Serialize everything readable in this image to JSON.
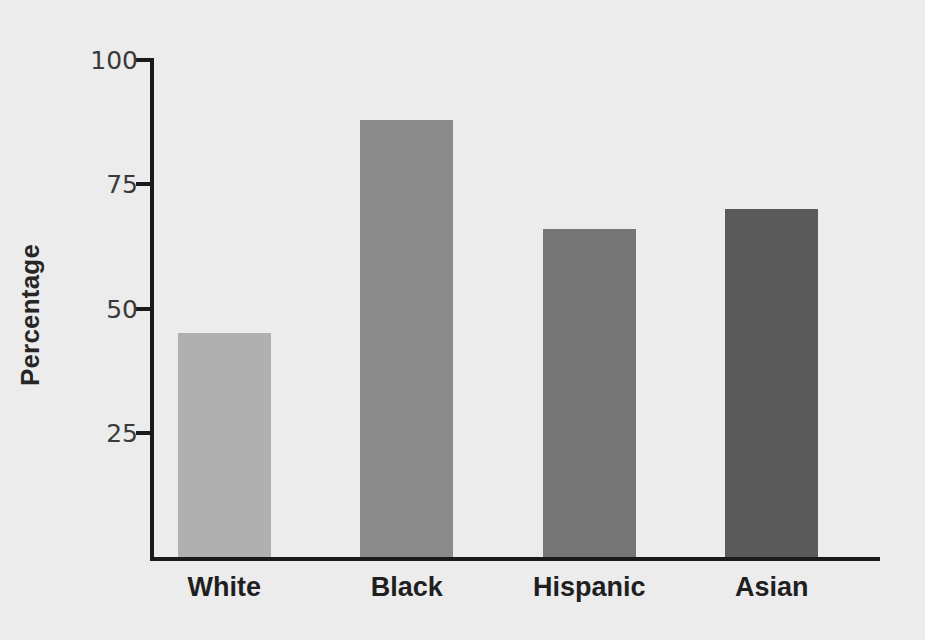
{
  "chart_data": {
    "type": "bar",
    "title": "",
    "xlabel": "",
    "ylabel": "Percentage",
    "categories": [
      "White",
      "Black",
      "Hispanic",
      "Asian"
    ],
    "values": [
      45,
      88,
      66,
      70
    ],
    "bar_colors": [
      "#b0b0b0",
      "#8a8a8a",
      "#757575",
      "#5a5a5a"
    ],
    "ylim": [
      0,
      100
    ],
    "yticks": [
      25,
      50,
      75,
      100
    ],
    "ytick_labels": [
      "25",
      "50",
      "75",
      "100"
    ],
    "xticks": [
      "White",
      "Black",
      "Hispanic",
      "Asian"
    ],
    "grid": false,
    "legend": "none",
    "background_color": "#ececec",
    "axis_color": "#1a1a1a"
  },
  "axes": {
    "y_label": "Percentage",
    "y_tick_0": "25",
    "y_tick_1": "50",
    "y_tick_2": "75",
    "y_tick_3": "100",
    "x_tick_0": "White",
    "x_tick_1": "Black",
    "x_tick_2": "Hispanic",
    "x_tick_3": "Asian"
  }
}
